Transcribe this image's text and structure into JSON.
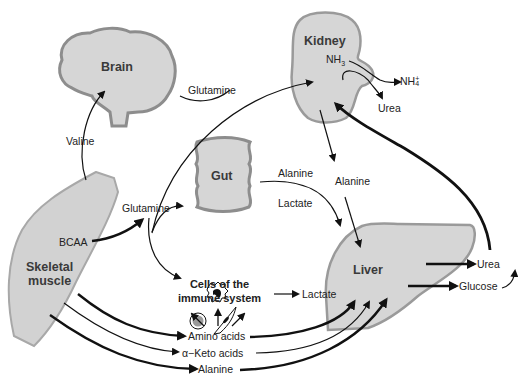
{
  "organs": {
    "brain": "Brain",
    "kidney": "Kidney",
    "gut": "Gut",
    "skeletal_muscle_line1": "Skeletal",
    "skeletal_muscle_line2": "muscle",
    "liver": "Liver",
    "immune_line1": "Cells of the",
    "immune_line2": "immune system"
  },
  "labels": {
    "valine": "Valine",
    "glutamine_top": "Glutamine",
    "glutamine_mid": "Glutamine",
    "bcaa": "BCAA",
    "alanine_gut": "Alanine",
    "lactate_gut": "Lactate",
    "alanine_kidney": "Alanine",
    "nh3": "NH",
    "nh3_sub": "3",
    "nh4": "NH",
    "nh4_sub": "4",
    "nh4_sup": "+",
    "urea_kidney": "Urea",
    "lactate_immune": "Lactate",
    "amino_acids": "Amino acids",
    "keto_acids": "α−Keto acids",
    "alanine_bottom": "Alanine",
    "urea_liver": "Urea",
    "glucose": "Glucose"
  },
  "colors": {
    "organ_fill": "#d4d4d4",
    "organ_edge": "#8a8a8a",
    "arrow": "#111111",
    "text": "#222222"
  }
}
